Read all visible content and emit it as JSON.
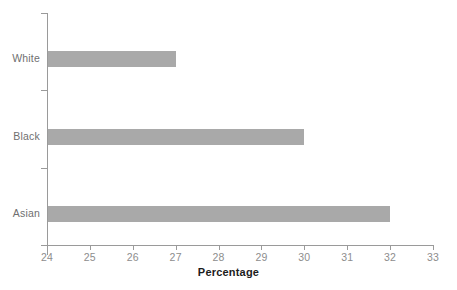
{
  "chart_data": {
    "type": "bar",
    "orientation": "horizontal",
    "title": "",
    "subtitle": "",
    "categories": [
      "White",
      "Black",
      "Asian"
    ],
    "values": [
      27,
      30,
      32
    ],
    "series": [
      {
        "name": "Percentage",
        "values": [
          27,
          30,
          32
        ]
      }
    ],
    "xlabel": "Percentage",
    "ylabel": "",
    "xlim": [
      24,
      33
    ],
    "xticks": [
      24,
      25,
      26,
      27,
      28,
      29,
      30,
      31,
      32,
      33
    ],
    "xtick_labels": [
      "24",
      "25",
      "26",
      "27",
      "28",
      "29",
      "30",
      "31",
      "32",
      "33"
    ],
    "ytick_labels": [
      "White",
      "Black",
      "Asian"
    ],
    "grid": false,
    "legend": false,
    "legend_position": "none",
    "bar_color": "#a9a9a9",
    "axis_color": "#9a9a9a",
    "tick_label_color": "#8d8d8d",
    "category_label_color": "#6f6f6f",
    "axis_title_color": "#1c1c1c",
    "background_color": "#ffffff",
    "annotations": []
  }
}
